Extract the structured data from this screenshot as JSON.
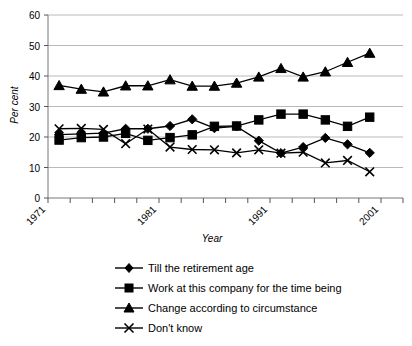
{
  "chart_data": {
    "type": "line",
    "title": "",
    "xlabel": "Year",
    "ylabel": "Per cent",
    "ylim": [
      0,
      60
    ],
    "ytick_values": [
      0,
      10,
      20,
      30,
      40,
      50,
      60
    ],
    "ytick_labels": [
      "0",
      "10",
      "20",
      "30",
      "40",
      "50",
      "60"
    ],
    "grid": true,
    "legend_position": "bottom",
    "x": [
      1971,
      1973,
      1975,
      1977,
      1979,
      1981,
      1983,
      1985,
      1987,
      1989,
      1991,
      1993,
      1995,
      1997,
      1999,
      2001
    ],
    "xtick_labels_shown": [
      "1971",
      "1981",
      "1991",
      "2001"
    ],
    "xtick_count": 17,
    "series": [
      {
        "name": "Till the retirement age",
        "marker": "diamond",
        "values": [
          20.8,
          21.0,
          21.3,
          22.7,
          22.7,
          23.6,
          25.8,
          22.9,
          23.5,
          18.8,
          14.7,
          16.7,
          19.7,
          17.6,
          14.8,
          null
        ]
      },
      {
        "name": "Work at this company for the time being",
        "marker": "square",
        "values": [
          19.0,
          19.8,
          20.0,
          21.2,
          18.9,
          19.8,
          20.7,
          23.5,
          23.6,
          25.6,
          27.5,
          27.5,
          25.6,
          23.5,
          26.5,
          null
        ]
      },
      {
        "name": "Change according to circumstance",
        "marker": "triangle",
        "values": [
          36.9,
          35.7,
          34.8,
          36.8,
          36.8,
          38.8,
          36.7,
          36.7,
          37.7,
          39.7,
          42.5,
          39.7,
          41.4,
          44.5,
          47.5,
          null
        ]
      },
      {
        "name": "Don't know",
        "marker": "x",
        "values": [
          22.7,
          22.8,
          22.5,
          17.8,
          22.6,
          16.7,
          15.9,
          15.8,
          14.8,
          15.8,
          14.7,
          15.0,
          11.5,
          12.3,
          8.6,
          null
        ]
      }
    ]
  },
  "axis": {
    "y_title": "Per cent",
    "x_title": "Year",
    "y_labels": [
      "60",
      "50",
      "40",
      "30",
      "20",
      "10",
      "0"
    ],
    "x_labels": [
      "1971",
      "1981",
      "1991",
      "2001"
    ]
  },
  "legend": {
    "items": [
      {
        "label": "Till the retirement age",
        "marker": "diamond-marker"
      },
      {
        "label": "Work at this company for the time being",
        "marker": "square-marker"
      },
      {
        "label": "Change according to circumstance",
        "marker": "triangle-marker"
      },
      {
        "label": "Don't know",
        "marker": "x-marker"
      }
    ]
  }
}
